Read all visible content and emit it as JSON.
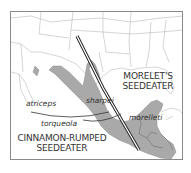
{
  "map": {
    "species": [
      {
        "id": "morelets",
        "line1": "MORELET'S",
        "line2": "SEEDEATER"
      },
      {
        "id": "cinnamon",
        "line1": "CINNAMON-RUMPED",
        "line2": "SEEDEATER"
      }
    ],
    "subspecies": [
      {
        "id": "atriceps",
        "label": "atriceps"
      },
      {
        "id": "sharpei",
        "label": "sharpei"
      },
      {
        "id": "torqueola",
        "label": "torqueola"
      },
      {
        "id": "morelleti",
        "label": "morelleti"
      }
    ],
    "colors": {
      "range_fill": "#a9a9a9",
      "land_lines": "#b5b5b5",
      "divider": "#222222",
      "frame": "#8a8a8a",
      "text": "#333333"
    }
  }
}
